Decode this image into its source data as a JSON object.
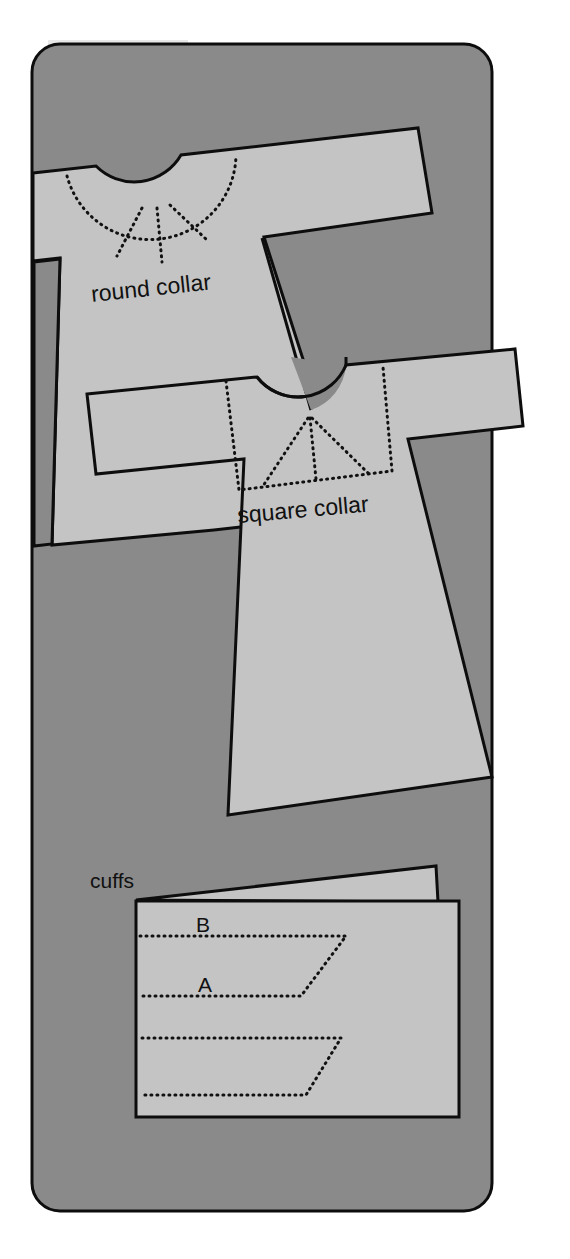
{
  "figure": {
    "colors": {
      "page_background": "#ffffff",
      "card_background": "#8a8a8a",
      "pattern_fill": "#c4c4c4",
      "outline": "#0d0d0d",
      "text": "#111111"
    }
  },
  "garments": {
    "round_collar": {
      "label": "round collar"
    },
    "square_collar": {
      "label": "square collar"
    }
  },
  "cuffs": {
    "title": "cuffs",
    "fold_labels": {
      "upper": "B",
      "lower": "A"
    }
  }
}
